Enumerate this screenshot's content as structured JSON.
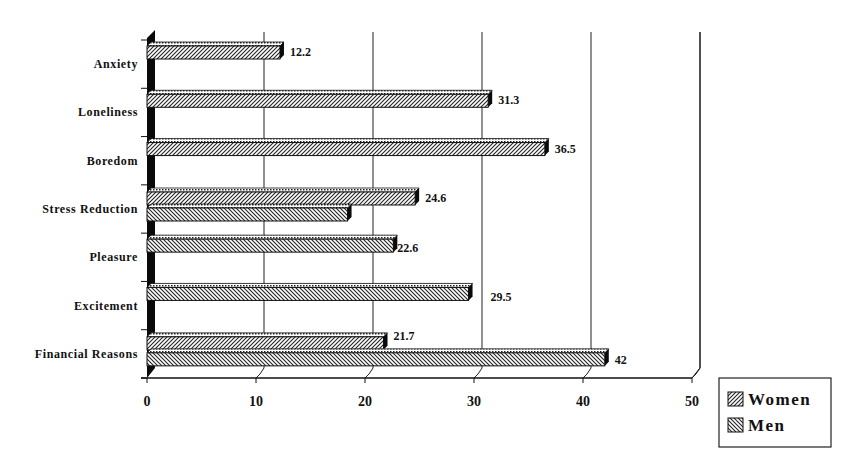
{
  "chart_data": {
    "type": "bar",
    "orientation": "horizontal",
    "style": "3d-clustered",
    "title": "",
    "xlabel": "",
    "ylabel": "",
    "xlim": [
      0,
      50
    ],
    "x_ticks": [
      0,
      10,
      20,
      30,
      40,
      50
    ],
    "grid": true,
    "legend_position": "bottom-right",
    "categories": [
      "Anxiety",
      "Loneliness",
      "Boredom",
      "Stress Reduction",
      "Pleasure",
      "Excitement",
      "Financial Reasons"
    ],
    "series": [
      {
        "name": "Women",
        "pattern": "forward-diagonal-hatch",
        "values": [
          12.2,
          31.3,
          36.5,
          24.6,
          null,
          null,
          21.7
        ]
      },
      {
        "name": "Men",
        "pattern": "backward-diagonal-hatch",
        "values": [
          null,
          null,
          null,
          18.4,
          22.6,
          29.5,
          42
        ]
      }
    ],
    "data_labels": [
      {
        "category": "Anxiety",
        "series": "Women",
        "text": "12.2"
      },
      {
        "category": "Loneliness",
        "series": "Women",
        "text": "31.3"
      },
      {
        "category": "Boredom",
        "series": "Women",
        "text": "36.5"
      },
      {
        "category": "Stress Reduction",
        "series": "Women",
        "text": "24.6"
      },
      {
        "category": "Stress Reduction",
        "series": "Men",
        "text": "18.4"
      },
      {
        "category": "Pleasure",
        "series": "Men",
        "text": "22.6"
      },
      {
        "category": "Excitement",
        "series": "Men",
        "text": "29.5"
      },
      {
        "category": "Financial Reasons",
        "series": "Women",
        "text": "21.7"
      },
      {
        "category": "Financial Reasons",
        "series": "Men",
        "text": "42"
      }
    ]
  },
  "legend": {
    "items": [
      {
        "label": "Women"
      },
      {
        "label": "Men"
      }
    ]
  },
  "colors": {
    "bar_stroke": "#111111",
    "hatch": "#222222",
    "bar_fill": "#ffffff",
    "axis": "#111111",
    "background": "#ffffff"
  }
}
